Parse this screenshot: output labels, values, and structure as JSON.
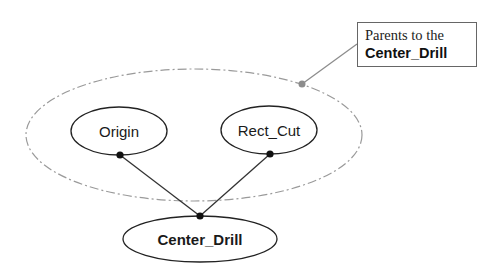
{
  "diagram": {
    "type": "parent-child dependency graph",
    "nodes": [
      {
        "id": "origin",
        "label": "Origin",
        "cx": 119,
        "cy": 131,
        "rx": 48,
        "ry": 24,
        "bold": false
      },
      {
        "id": "rect_cut",
        "label": "Rect_Cut",
        "cx": 269,
        "cy": 130,
        "rx": 48,
        "ry": 24,
        "bold": false
      },
      {
        "id": "center_drill",
        "label": "Center_Drill",
        "cx": 200,
        "cy": 239,
        "rx": 77,
        "ry": 23,
        "bold": true
      }
    ],
    "edges": [
      {
        "from": "origin",
        "to": "center_drill"
      },
      {
        "from": "rect_cut",
        "to": "center_drill"
      }
    ],
    "group": {
      "label_line1": "Parents to the",
      "label_line2": "Center_Drill",
      "members": [
        "origin",
        "rect_cut"
      ],
      "style": "dash-dot"
    },
    "colors": {
      "node_stroke": "#222222",
      "edge": "#333333",
      "group_stroke": "#9a9a9a",
      "callout_dot": "#8c8c8c",
      "connector_dot": "#111111"
    }
  }
}
